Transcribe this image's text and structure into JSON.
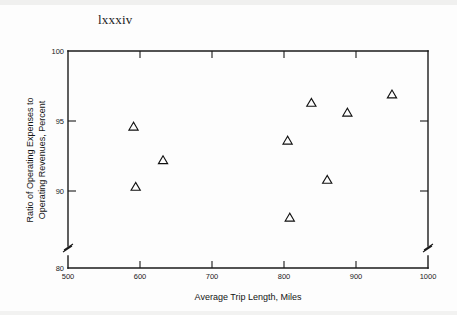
{
  "page": {
    "folio": "lxxxiv",
    "background_color": "#ffffff",
    "ink_color": "#1a1a1a"
  },
  "chart_data": {
    "type": "scatter",
    "title": "",
    "xlabel": "Average Trip Length, Miles",
    "ylabel": "Ratio of Operating Expenses to Operating Revenues, Percent",
    "ylabel_line1": "Ratio of Operating Expenses to",
    "ylabel_line2": "Operating Revenues, Percent",
    "xlim": [
      500,
      1000
    ],
    "ylim": [
      80,
      100
    ],
    "xticks": [
      500,
      600,
      700,
      800,
      900,
      1000
    ],
    "xticklabels": [
      "500",
      "600",
      "700",
      "800",
      "900",
      "1000"
    ],
    "yticks": [
      80,
      90,
      95,
      100
    ],
    "yticklabels": [
      "80",
      "90",
      "95",
      "100"
    ],
    "y_axis_break": true,
    "y_axis_break_between": [
      80,
      90
    ],
    "grid": false,
    "legend": null,
    "marker": "triangle-up-open",
    "marker_color": "#111111",
    "series": [
      {
        "name": "Railroads",
        "points": [
          {
            "x": 591,
            "y": 94.6
          },
          {
            "x": 594,
            "y": 90.3
          },
          {
            "x": 632,
            "y": 92.2
          },
          {
            "x": 805,
            "y": 93.6
          },
          {
            "x": 808,
            "y": 88.1
          },
          {
            "x": 838,
            "y": 96.3
          },
          {
            "x": 860,
            "y": 90.8
          },
          {
            "x": 888,
            "y": 95.6
          },
          {
            "x": 950,
            "y": 96.9
          }
        ]
      }
    ]
  }
}
